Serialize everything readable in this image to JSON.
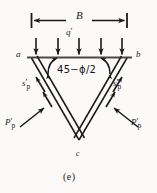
{
  "figure": {
    "caption": "(e)",
    "type": "bearing-capacity-failure-wedge-diagram",
    "background_color": "#fbfaf8",
    "ink_color": "#1a1a1a"
  },
  "dimension": {
    "label": "B",
    "description": "footing width dimension line with opposing arrowheads and end ticks"
  },
  "surcharge": {
    "label": "q",
    "prime": "′",
    "arrow_count": 5,
    "direction": "down"
  },
  "corners": {
    "left": "a",
    "right": "b",
    "apex": "c"
  },
  "angle": {
    "label": "45−ϕ/2",
    "arc_count": 2
  },
  "shear_force": {
    "symbol": "s",
    "prime": "′",
    "subscript": "p",
    "left_label": "s′p",
    "right_label": "s′p"
  },
  "passive_force": {
    "symbol": "P",
    "prime": "′",
    "subscript": "p",
    "left_label": "P′p",
    "right_label": "P′p"
  },
  "geometry": {
    "wedge_left_x": 31,
    "wedge_right_x": 127,
    "wedge_top_y": 57,
    "wedge_apex_x": 79,
    "wedge_apex_y": 140
  }
}
